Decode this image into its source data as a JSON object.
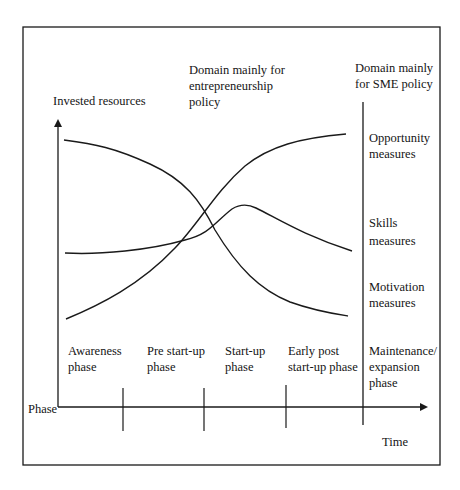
{
  "diagram": {
    "type": "policy-phase-diagram",
    "y_axis_label": "Invested resources",
    "x_axis_label": "Time",
    "phase_axis_label": "Phase",
    "domains": {
      "entrepreneurship": {
        "line1": "Domain mainly for",
        "line2": "entrepreneurship",
        "line3": "policy"
      },
      "sme": {
        "line1": "Domain mainly",
        "line2": "for SME policy"
      }
    },
    "measures": [
      {
        "id": "opportunity",
        "line1": "Opportunity",
        "line2": "measures",
        "trend": "increasing S-curve"
      },
      {
        "id": "skills",
        "line1": "Skills",
        "line2": "measures",
        "trend": "flat, peak at start-up, then declining"
      },
      {
        "id": "motivation",
        "line1": "Motivation",
        "line2": "measures",
        "trend": "decreasing S-curve"
      }
    ],
    "phases": [
      {
        "line1": "Awareness",
        "line2": "phase"
      },
      {
        "line1": "Pre start-up",
        "line2": "phase"
      },
      {
        "line1": "Start-up",
        "line2": "phase"
      },
      {
        "line1": "Early post",
        "line2": "start-up phase"
      },
      {
        "line1": "Maintenance/",
        "line2": "expansion",
        "line3": "phase"
      }
    ],
    "colors": {
      "line": "#1a1a1a",
      "background": "#ffffff"
    }
  }
}
